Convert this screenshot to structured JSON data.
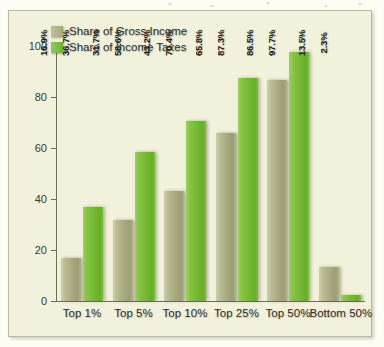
{
  "chart_data": {
    "type": "bar",
    "title": "",
    "subtitle": "",
    "xlabel": "",
    "ylabel": "",
    "ylim": [
      0,
      100
    ],
    "yticks": [
      "0",
      "20",
      "40",
      "60",
      "80",
      "100"
    ],
    "grid": false,
    "legend_position": "top-left",
    "categories": [
      "Top 1%",
      "Top 5%",
      "Top 10%",
      "Top 25%",
      "Top 50%",
      "Bottom 50%"
    ],
    "series": [
      {
        "name": "Share of Gross Income",
        "color": "#a9a980",
        "values": [
          16.9,
          31.7,
          43.2,
          65.8,
          86.5,
          13.5
        ],
        "labels": [
          "16.9%",
          "31.7%",
          "43.2%",
          "65.8%",
          "86.5%",
          "13.5%"
        ]
      },
      {
        "name": "Share of Income Taxes",
        "color": "#74b833",
        "values": [
          36.7,
          58.6,
          70.4,
          87.3,
          97.7,
          2.3
        ],
        "labels": [
          "36.7%",
          "58.6%",
          "70.4%",
          "87.3%",
          "97.7%",
          "2.3%"
        ]
      }
    ]
  },
  "legend": {
    "items": [
      {
        "label": "Share of Gross Income",
        "swatch": "tan"
      },
      {
        "label": "Share of Income Taxes",
        "swatch": "green"
      }
    ]
  },
  "axis": {
    "y_ticks": [
      {
        "value": "100"
      },
      {
        "value": "80"
      },
      {
        "value": "60"
      },
      {
        "value": "40"
      },
      {
        "value": "20"
      },
      {
        "value": "0"
      }
    ]
  },
  "colors": {
    "green": "#74b833",
    "tan": "#a9a980",
    "plot_background": "#f1f1dc",
    "frame_border": "#b9b9a0",
    "axis": "#6d6d5a",
    "text": "#2f2f28"
  }
}
